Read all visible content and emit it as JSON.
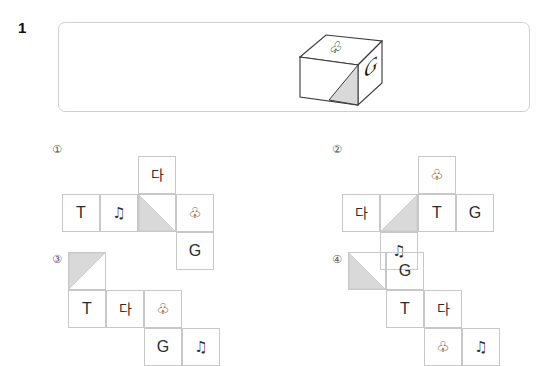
{
  "question": {
    "number": "1",
    "figure": {
      "name": "cube-figure",
      "type": "isometric-cube",
      "faces": {
        "top": "♧",
        "right": "G",
        "front": "shaded-triangle"
      },
      "shading_color": "#d9d9d9",
      "outline_color": "#3a3a3a"
    }
  },
  "options": [
    {
      "label": "①",
      "name": "option-1",
      "cells": [
        {
          "name": "cell-da",
          "text": "다",
          "kind": "ko",
          "col": 2,
          "row": 0
        },
        {
          "name": "cell-t",
          "text": "T",
          "kind": "letter",
          "col": 0,
          "row": 1
        },
        {
          "name": "cell-note",
          "text": "♫",
          "kind": "sym",
          "col": 1,
          "row": 1
        },
        {
          "name": "cell-tri",
          "text": "",
          "kind": "tri",
          "col": 2,
          "row": 1,
          "triangle": "bottom-left"
        },
        {
          "name": "cell-club",
          "text": "♧",
          "kind": "sym",
          "col": 3,
          "row": 1
        },
        {
          "name": "cell-g",
          "text": "G",
          "kind": "letter",
          "col": 3,
          "row": 2
        }
      ]
    },
    {
      "label": "②",
      "name": "option-2",
      "cells": [
        {
          "name": "cell-club",
          "text": "♧",
          "kind": "sym",
          "col": 2,
          "row": 0
        },
        {
          "name": "cell-da",
          "text": "다",
          "kind": "ko",
          "col": 0,
          "row": 1
        },
        {
          "name": "cell-tri",
          "text": "",
          "kind": "tri",
          "col": 1,
          "row": 1,
          "triangle": "bottom-right"
        },
        {
          "name": "cell-t",
          "text": "T",
          "kind": "letter",
          "col": 2,
          "row": 1
        },
        {
          "name": "cell-g",
          "text": "G",
          "kind": "letter",
          "col": 3,
          "row": 1
        },
        {
          "name": "cell-note",
          "text": "♫",
          "kind": "sym",
          "col": 1,
          "row": 2
        }
      ]
    },
    {
      "label": "③",
      "name": "option-3",
      "cells": [
        {
          "name": "cell-tri",
          "text": "",
          "kind": "tri",
          "col": 0,
          "row": 0,
          "triangle": "top-left"
        },
        {
          "name": "cell-t",
          "text": "T",
          "kind": "letter",
          "col": 0,
          "row": 1
        },
        {
          "name": "cell-da",
          "text": "다",
          "kind": "ko",
          "col": 1,
          "row": 1
        },
        {
          "name": "cell-club",
          "text": "♧",
          "kind": "sym",
          "col": 2,
          "row": 1
        },
        {
          "name": "cell-g",
          "text": "G",
          "kind": "letter",
          "col": 2,
          "row": 2
        },
        {
          "name": "cell-note",
          "text": "♫",
          "kind": "sym",
          "col": 3,
          "row": 2
        }
      ]
    },
    {
      "label": "④",
      "name": "option-4",
      "cells": [
        {
          "name": "cell-tri",
          "text": "",
          "kind": "tri",
          "col": 0,
          "row": 0,
          "triangle": "bottom-left"
        },
        {
          "name": "cell-g",
          "text": "G",
          "kind": "letter",
          "col": 1,
          "row": 0
        },
        {
          "name": "cell-t",
          "text": "T",
          "kind": "letter",
          "col": 1,
          "row": 1
        },
        {
          "name": "cell-da",
          "text": "다",
          "kind": "ko",
          "col": 2,
          "row": 1
        },
        {
          "name": "cell-club",
          "text": "♧",
          "kind": "sym",
          "col": 2,
          "row": 2
        },
        {
          "name": "cell-note",
          "text": "♫",
          "kind": "sym",
          "col": 3,
          "row": 2
        }
      ]
    }
  ],
  "style": {
    "cell_size": 38,
    "grid_line_color": "#c8c8c8",
    "box_border_color": "#cfcfcf",
    "shade_fill": "#d9d9d9",
    "text_color": "#2b2b2b"
  }
}
